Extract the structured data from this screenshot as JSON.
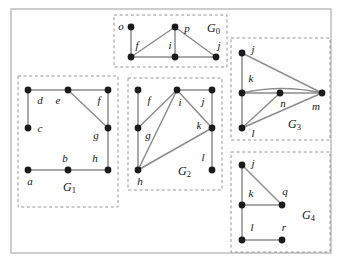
{
  "figure": {
    "width": 339,
    "height": 266,
    "background_color": "#ffffff",
    "frame_color": "#b9b9b9",
    "box_color": "#8a8a8a",
    "edge_color": "#8d8d8d",
    "vertex_color": "#1b1b1b"
  },
  "groups": [
    {
      "id": "G0",
      "label": "G",
      "subscript": "0",
      "label_x": 207,
      "label_y": 29,
      "box": {
        "x": 114,
        "y": 15,
        "w": 113,
        "h": 52
      },
      "vertices": [
        {
          "name": "o",
          "x": 131,
          "y": 27,
          "label_x": 121,
          "label_y": 27
        },
        {
          "name": "p",
          "x": 175,
          "y": 27,
          "label_x": 187,
          "label_y": 29
        },
        {
          "name": "f",
          "x": 131,
          "y": 57,
          "label_x": 137,
          "label_y": 46
        },
        {
          "name": "i",
          "x": 175,
          "y": 57,
          "label_x": 170,
          "label_y": 46
        },
        {
          "name": "j",
          "x": 216,
          "y": 57,
          "label_x": 219,
          "label_y": 46
        }
      ],
      "edges": [
        {
          "from": "o",
          "to": "f"
        },
        {
          "from": "f",
          "to": "p"
        },
        {
          "from": "p",
          "to": "i"
        },
        {
          "from": "p",
          "to": "j"
        },
        {
          "from": "f",
          "to": "i"
        },
        {
          "from": "i",
          "to": "j"
        }
      ]
    },
    {
      "id": "G1",
      "label": "G",
      "subscript": "1",
      "label_x": 63,
      "label_y": 188,
      "box": {
        "x": 18,
        "y": 76,
        "w": 100,
        "h": 131
      },
      "vertices": [
        {
          "name": "d",
          "x": 28,
          "y": 90,
          "label_x": 40,
          "label_y": 101
        },
        {
          "name": "e",
          "x": 68,
          "y": 90,
          "label_x": 58,
          "label_y": 101
        },
        {
          "name": "f",
          "x": 108,
          "y": 90,
          "label_x": 99,
          "label_y": 101
        },
        {
          "name": "c",
          "x": 28,
          "y": 128,
          "label_x": 40,
          "label_y": 129
        },
        {
          "name": "g",
          "x": 108,
          "y": 128,
          "label_x": 96,
          "label_y": 136
        },
        {
          "name": "a",
          "x": 28,
          "y": 170,
          "label_x": 30,
          "label_y": 182
        },
        {
          "name": "b",
          "x": 68,
          "y": 170,
          "label_x": 65,
          "label_y": 159
        },
        {
          "name": "h",
          "x": 108,
          "y": 170,
          "label_x": 95,
          "label_y": 159
        }
      ],
      "edges": [
        {
          "from": "d",
          "to": "e"
        },
        {
          "from": "e",
          "to": "f"
        },
        {
          "from": "d",
          "to": "c"
        },
        {
          "from": "e",
          "to": "g"
        },
        {
          "from": "f",
          "to": "g"
        },
        {
          "from": "g",
          "to": "h"
        },
        {
          "from": "a",
          "to": "b"
        },
        {
          "from": "b",
          "to": "h"
        }
      ]
    },
    {
      "id": "G2",
      "label": "G",
      "subscript": "2",
      "label_x": 178,
      "label_y": 172,
      "box": {
        "x": 128,
        "y": 78,
        "w": 94,
        "h": 112
      },
      "vertices": [
        {
          "name": "f",
          "x": 138,
          "y": 90,
          "label_x": 149,
          "label_y": 101
        },
        {
          "name": "i",
          "x": 177,
          "y": 90,
          "label_x": 180,
          "label_y": 103
        },
        {
          "name": "j",
          "x": 212,
          "y": 90,
          "label_x": 203,
          "label_y": 102
        },
        {
          "name": "g",
          "x": 138,
          "y": 128,
          "label_x": 148,
          "label_y": 136
        },
        {
          "name": "k",
          "x": 212,
          "y": 128,
          "label_x": 199,
          "label_y": 126
        },
        {
          "name": "h",
          "x": 138,
          "y": 170,
          "label_x": 140,
          "label_y": 182
        },
        {
          "name": "l",
          "x": 212,
          "y": 170,
          "label_x": 203,
          "label_y": 158
        }
      ],
      "edges": [
        {
          "from": "f",
          "to": "g"
        },
        {
          "from": "g",
          "to": "h"
        },
        {
          "from": "g",
          "to": "i"
        },
        {
          "from": "h",
          "to": "i"
        },
        {
          "from": "i",
          "to": "j"
        },
        {
          "from": "i",
          "to": "k"
        },
        {
          "from": "j",
          "to": "k"
        },
        {
          "from": "h",
          "to": "k"
        },
        {
          "from": "k",
          "to": "l"
        }
      ]
    },
    {
      "id": "G3",
      "label": "G",
      "subscript": "3",
      "label_x": 288,
      "label_y": 125,
      "box": {
        "x": 231,
        "y": 38,
        "w": 99,
        "h": 102
      },
      "vertices": [
        {
          "name": "j",
          "x": 242,
          "y": 53,
          "label_x": 253,
          "label_y": 50
        },
        {
          "name": "k",
          "x": 242,
          "y": 93,
          "label_x": 251,
          "label_y": 79
        },
        {
          "name": "n",
          "x": 280,
          "y": 93,
          "label_x": 283,
          "label_y": 104
        },
        {
          "name": "m",
          "x": 322,
          "y": 93,
          "label_x": 316,
          "label_y": 107
        },
        {
          "name": "l",
          "x": 242,
          "y": 128,
          "label_x": 253,
          "label_y": 134
        }
      ],
      "edges": [
        {
          "from": "j",
          "to": "k"
        },
        {
          "from": "j",
          "to": "m"
        },
        {
          "from": "k",
          "to": "n"
        },
        {
          "from": "n",
          "to": "m"
        },
        {
          "from": "k",
          "to": "m",
          "curved": true,
          "bow": -9
        },
        {
          "from": "k",
          "to": "l"
        },
        {
          "from": "l",
          "to": "n"
        },
        {
          "from": "l",
          "to": "m"
        }
      ]
    },
    {
      "id": "G4",
      "label": "G",
      "subscript": "4",
      "label_x": 302,
      "label_y": 216,
      "box": {
        "x": 231,
        "y": 152,
        "w": 99,
        "h": 100
      },
      "vertices": [
        {
          "name": "j",
          "x": 242,
          "y": 165,
          "label_x": 253,
          "label_y": 164
        },
        {
          "name": "k",
          "x": 242,
          "y": 205,
          "label_x": 251,
          "label_y": 194
        },
        {
          "name": "q",
          "x": 282,
          "y": 205,
          "label_x": 285,
          "label_y": 192
        },
        {
          "name": "l",
          "x": 242,
          "y": 240,
          "label_x": 252,
          "label_y": 228
        },
        {
          "name": "r",
          "x": 282,
          "y": 240,
          "label_x": 284,
          "label_y": 228
        }
      ],
      "edges": [
        {
          "from": "j",
          "to": "k"
        },
        {
          "from": "j",
          "to": "q"
        },
        {
          "from": "k",
          "to": "q"
        },
        {
          "from": "k",
          "to": "l"
        },
        {
          "from": "l",
          "to": "r"
        }
      ]
    }
  ],
  "outer_frame": {
    "x": 11,
    "y": 9,
    "w": 320,
    "h": 244
  }
}
